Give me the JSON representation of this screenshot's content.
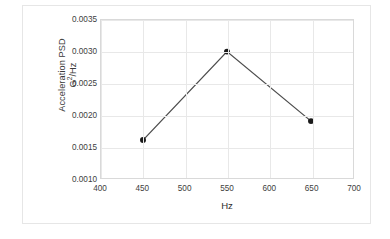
{
  "chart_data": {
    "type": "line",
    "title": "",
    "subtitle": "",
    "xlabel": "Hz",
    "ylabel_lines": [
      "Acceleration PSD",
      "G²/Hz"
    ],
    "ylabel": "Acceleration PSD G²/Hz",
    "x": [
      450,
      550,
      650
    ],
    "values": [
      0.0016,
      0.003,
      0.0019
    ],
    "series": [
      {
        "name": "Acceleration PSD",
        "x": [
          450,
          550,
          650
        ],
        "values": [
          0.0016,
          0.003,
          0.0019
        ],
        "line_color": "#4d4d4d",
        "marker_color": "#1a1a1a",
        "marker": "circle"
      }
    ],
    "xlim": [
      400,
      700
    ],
    "ylim": [
      0.001,
      0.0035
    ],
    "xticks": [
      400,
      450,
      500,
      550,
      600,
      650,
      700
    ],
    "xtick_labels": [
      "400",
      "450",
      "500",
      "550",
      "600",
      "650",
      "700"
    ],
    "yticks": [
      0.001,
      0.0015,
      0.002,
      0.0025,
      0.003,
      0.0035
    ],
    "ytick_labels": [
      "0.0010",
      "0.0015",
      "0.0020",
      "0.0025",
      "0.0030",
      "0.0035"
    ],
    "grid": {
      "horizontal": true,
      "vertical": true,
      "color": "#e8e8e8"
    },
    "legend": {
      "visible": false,
      "position": "none",
      "entries": []
    },
    "plot_border_color": "#d9d9d9",
    "figure_border_color": "#e6e6e6",
    "background_color": "#ffffff"
  }
}
